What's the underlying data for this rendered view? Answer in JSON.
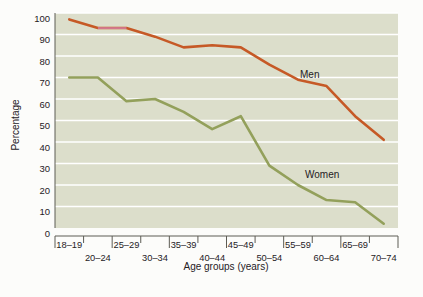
{
  "chart_data": {
    "type": "line",
    "title": "",
    "xlabel": "Age groups (years)",
    "ylabel": "Percentage",
    "grid": true,
    "grid_axis": "y",
    "legend_position": "inline-annotation",
    "plot_background": "#dcdecb",
    "ylim": [
      0,
      100
    ],
    "yticks": [
      0,
      10,
      20,
      30,
      40,
      50,
      60,
      70,
      80,
      90,
      100
    ],
    "ytick_labels": [
      "0",
      "10",
      "20",
      "30",
      "40",
      "50",
      "60",
      "70",
      "80",
      "90",
      "100"
    ],
    "categories": [
      "18–19",
      "20–24",
      "25–29",
      "30–34",
      "35–39",
      "40–44",
      "45–49",
      "50–54",
      "55–59",
      "60–64",
      "65–69",
      "70–74"
    ],
    "xtick_labels_upper_row": [
      "18–19",
      "25–29",
      "35–39",
      "45–49",
      "55–59",
      "65–69"
    ],
    "xtick_labels_lower_row": [
      "20–24",
      "30–34",
      "40–44",
      "50–54",
      "60–64",
      "70–74"
    ],
    "series": [
      {
        "name": "Men",
        "color": "#c65926",
        "label_text": "Men",
        "values": [
          97,
          93,
          93,
          89,
          84,
          85,
          84,
          76,
          69,
          66,
          52,
          41
        ]
      },
      {
        "name": "Women",
        "color": "#93a05b",
        "label_text": "Women",
        "values": [
          70,
          70,
          59,
          60,
          54,
          46,
          52,
          29,
          20,
          13,
          12,
          2
        ]
      }
    ],
    "highlight_segment": {
      "series": "Men",
      "from_category": "20–24",
      "to_category": "25–29",
      "color": "#d47b93"
    }
  },
  "annotations": {
    "men_label": "Men",
    "women_label": "Women"
  },
  "axis": {
    "x_title": "Age groups (years)",
    "y_title": "Percentage"
  }
}
